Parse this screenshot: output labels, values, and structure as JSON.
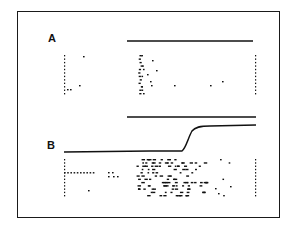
{
  "figure": {
    "panels": [
      {
        "label": "A",
        "stimulus_bar": {
          "x1": 127,
          "x2": 253,
          "y": 41
        },
        "raster": {
          "y_top": 55,
          "y_bottom": 93,
          "rows": 12,
          "left_tick_x": 64,
          "right_tick_x": 255
        }
      },
      {
        "label": "B",
        "stimulus_bar": {
          "x1": 127,
          "x2": 256,
          "y": 117
        },
        "step_trace": {
          "baseline_y": 152,
          "plateau_y": 126,
          "rise_start_x": 183,
          "rise_end_x": 198
        },
        "raster": {
          "y_top": 159,
          "y_bottom": 195,
          "rows": 12,
          "left_tick_x": 64,
          "right_tick_x": 255
        }
      }
    ],
    "colors": {
      "ink": "#111111",
      "background": "#ffffff"
    }
  }
}
